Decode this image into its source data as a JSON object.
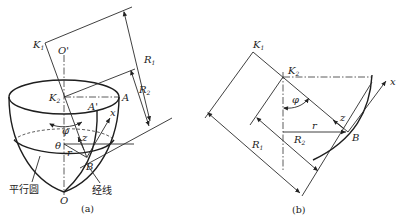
{
  "figure_a": {
    "caption": "(a)",
    "labels": {
      "K1": "K",
      "K1_sub": "1",
      "O_prime": "O'",
      "K2": "K",
      "K2_sub": "2",
      "A": "A",
      "A_prime": "A'",
      "R1": "R",
      "R1_sub": "1",
      "R2": "R",
      "R2_sub": "2",
      "x": "x",
      "z": "z",
      "phi": "φ",
      "theta": "θ",
      "r": "r",
      "B": "B",
      "O": "O",
      "parallel_circle": "平行圆",
      "meridian": "经线"
    }
  },
  "figure_b": {
    "caption": "(b)",
    "labels": {
      "K1": "K",
      "K1_sub": "1",
      "K2": "K",
      "K2_sub": "2",
      "phi": "φ",
      "x": "x",
      "z": "z",
      "r": "r",
      "B": "B",
      "R1": "R",
      "R1_sub": "1",
      "R2": "R",
      "R2_sub": "2"
    }
  }
}
